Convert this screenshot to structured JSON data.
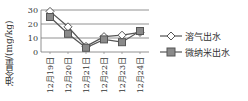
{
  "chart_data": {
    "type": "line",
    "title": "",
    "xlabel": "",
    "ylabel": "油含量/(mg/kg)",
    "categories": [
      "12月19日",
      "12月20日",
      "12月21日",
      "12月22日",
      "12月23日",
      "12月24日"
    ],
    "yticks": [
      0,
      10,
      20,
      30
    ],
    "ylim": [
      0,
      30
    ],
    "grid": true,
    "legend_position": "right",
    "series": [
      {
        "name": "溶气出水",
        "marker": "diamond-open",
        "values": [
          29,
          18,
          4,
          11,
          12,
          14
        ]
      },
      {
        "name": "微纳米出水",
        "marker": "square-filled",
        "values": [
          25,
          13,
          3,
          9,
          7,
          15
        ]
      }
    ]
  },
  "colors": {
    "line": "#555555",
    "marker_fill": "#8a8a8a",
    "grid": "#777777"
  }
}
